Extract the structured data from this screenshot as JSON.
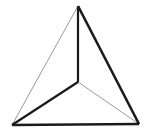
{
  "figure": {
    "name": "tetrahedron-wireframe",
    "background_color": "#ffffff",
    "width": 150,
    "height": 132,
    "colors": {
      "edge_dark": "#1a1a1a",
      "edge_light": "#9a9a9a",
      "background": "#ffffff"
    },
    "vertices": [
      {
        "id": "apex",
        "label": "apex",
        "x": 78,
        "y": 6
      },
      {
        "id": "bottom_left",
        "label": "bottom-left vertex",
        "x": 12,
        "y": 125
      },
      {
        "id": "bottom_right",
        "label": "bottom-right vertex",
        "x": 139,
        "y": 124
      },
      {
        "id": "center",
        "label": "interior center vertex",
        "x": 78,
        "y": 82
      }
    ],
    "edges": [
      {
        "id": "apex-to-bottom-left",
        "label": "left outer edge",
        "from": "apex",
        "to": "bottom_left",
        "path": "M 78 6 L 12 125",
        "weight": "thin",
        "stroke_width": 1,
        "color": "#9a9a9a"
      },
      {
        "id": "apex-to-bottom-right",
        "label": "right outer edge",
        "from": "apex",
        "to": "bottom_right",
        "path": "M 78 6 L 139 124",
        "weight": "thick",
        "stroke_width": 2.6,
        "color": "#1a1a1a"
      },
      {
        "id": "bottom-left-to-bottom-right",
        "label": "bottom outer edge",
        "from": "bottom_left",
        "to": "bottom_right",
        "path": "M 12 125 L 139 124",
        "weight": "thick",
        "stroke_width": 2.6,
        "color": "#1a1a1a"
      },
      {
        "id": "center-to-apex",
        "label": "vertical interior edge",
        "from": "center",
        "to": "apex",
        "path": "M 78 82 L 78 6",
        "weight": "thick",
        "stroke_width": 2.2,
        "color": "#1a1a1a"
      },
      {
        "id": "center-to-bottom-left",
        "label": "lower-left interior edge",
        "from": "center",
        "to": "bottom_left",
        "path": "M 78 82 L 12 125",
        "weight": "thick",
        "stroke_width": 2.2,
        "color": "#1a1a1a"
      },
      {
        "id": "center-to-bottom-right",
        "label": "lower-right interior edge",
        "from": "center",
        "to": "bottom_right",
        "path": "M 78 82 L 139 124",
        "weight": "thin",
        "stroke_width": 1,
        "color": "#9a9a9a"
      }
    ]
  }
}
